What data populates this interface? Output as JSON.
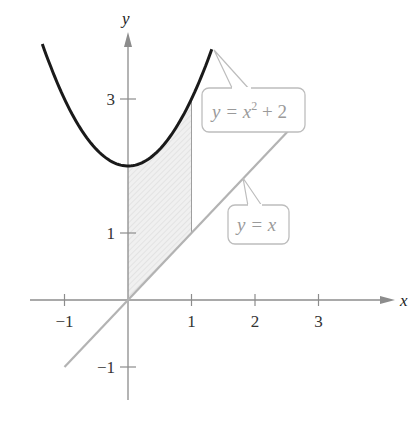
{
  "figure": {
    "x_axis_label": "x",
    "y_axis_label": "y",
    "x_ticks": [
      {
        "value": -1,
        "label": "−1"
      },
      {
        "value": 1,
        "label": "1"
      },
      {
        "value": 2,
        "label": "2"
      },
      {
        "value": 3,
        "label": "3"
      }
    ],
    "y_ticks": [
      {
        "value": 3,
        "label": "3"
      },
      {
        "value": 1,
        "label": "1"
      },
      {
        "value": -1,
        "label": "−1"
      }
    ],
    "curves": [
      {
        "name": "parabola",
        "equation_label": "y = x² + 2",
        "label_main": "y = x",
        "label_sup": "2",
        "label_tail": " + 2",
        "x_range": [
          -1.35,
          1.32
        ],
        "color": "#1a1a1a"
      },
      {
        "name": "line",
        "equation_label": "y = x",
        "x_range": [
          -1,
          2.72
        ],
        "color": "#b3b3b3"
      }
    ],
    "shaded_region": {
      "x_from": 0,
      "x_to": 1,
      "between": [
        "y = x",
        "y = x^2 + 2"
      ],
      "fill": "#efefef",
      "hatch": "#d4d4d4"
    },
    "colors": {
      "axis": "#8c8c8c",
      "label_box": "#bdbdbd",
      "label_text": "#9a9a9a"
    }
  },
  "chart_data": {
    "type": "line",
    "title": "",
    "xlabel": "x",
    "ylabel": "y",
    "xlim": [
      -1.5,
      4
    ],
    "ylim": [
      -1.5,
      4
    ],
    "series": [
      {
        "name": "y = x^2 + 2",
        "function": "x^2 + 2",
        "x_range": [
          -1.35,
          1.32
        ]
      },
      {
        "name": "y = x",
        "function": "x",
        "x_range": [
          -1,
          2.72
        ]
      }
    ],
    "shaded_between": {
      "x": [
        0,
        1
      ],
      "upper": "y = x^2 + 2",
      "lower": "y = x"
    },
    "grid": false
  }
}
